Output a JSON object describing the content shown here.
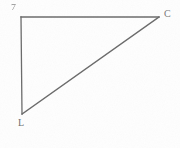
{
  "figure": {
    "type": "geometry-diagram",
    "shape_name": "right-triangle",
    "background_color": "#fefefe",
    "stroke_color": "#6a6a6a",
    "stroke_width": 1.3,
    "canvas": {
      "width": 180,
      "height": 148
    },
    "vertices": [
      {
        "id": "apex",
        "label": "7",
        "x": 21,
        "y": 17,
        "label_x": 11,
        "label_y": 3
      },
      {
        "id": "right",
        "label": "C",
        "x": 159,
        "y": 17,
        "label_x": 164,
        "label_y": 9
      },
      {
        "id": "bottom",
        "label": "L",
        "x": 22,
        "y": 114,
        "label_x": 18,
        "label_y": 118
      }
    ],
    "edges": [
      {
        "id": "top-edge",
        "from": "apex",
        "to": "right"
      },
      {
        "id": "left-edge",
        "from": "apex",
        "to": "bottom"
      },
      {
        "id": "hypotenuse-edge",
        "from": "bottom",
        "to": "right"
      }
    ]
  },
  "chart_data": {
    "type": "scatter",
    "title": "",
    "xlabel": "",
    "ylabel": "",
    "xlim": [
      0,
      180
    ],
    "ylim": [
      0,
      148
    ],
    "grid": false,
    "legend": "none",
    "points": [
      {
        "label": "7",
        "x": 21,
        "y": 17
      },
      {
        "label": "C",
        "x": 159,
        "y": 17
      },
      {
        "label": "L",
        "x": 22,
        "y": 114
      }
    ],
    "lines": [
      {
        "name": "top-edge",
        "x": [
          21,
          159
        ],
        "y": [
          17,
          17
        ]
      },
      {
        "name": "left-edge",
        "x": [
          21,
          22
        ],
        "y": [
          17,
          114
        ]
      },
      {
        "name": "hypotenuse-edge",
        "x": [
          22,
          159
        ],
        "y": [
          114,
          17
        ]
      }
    ]
  }
}
